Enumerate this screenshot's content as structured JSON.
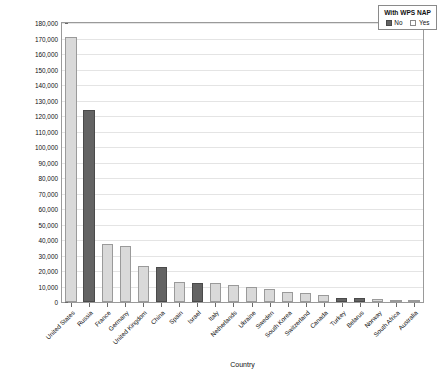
{
  "chart_data": {
    "type": "bar",
    "title": "",
    "xlabel": "Country",
    "ylabel": "Total TIV 2000–2020",
    "ylim": [
      0,
      180000
    ],
    "ytick_step": 10000,
    "grid": true,
    "legend_position": "top-right",
    "legend_title": "With WPS NAP",
    "categories": [
      "United States",
      "Russia",
      "France",
      "Germany",
      "United Kingdom",
      "China",
      "Spain",
      "Israel",
      "Italy",
      "Netherlands",
      "Ukraine",
      "Sweden",
      "South Korea",
      "Switzerland",
      "Canada",
      "Turkey",
      "Belarus",
      "Norway",
      "South Africa",
      "Australia"
    ],
    "values": [
      171000,
      124000,
      37500,
      36000,
      23500,
      22500,
      13000,
      12500,
      12400,
      11200,
      9500,
      8200,
      6600,
      5800,
      4500,
      2400,
      2300,
      1800,
      1600,
      1500
    ],
    "groups": [
      "Yes",
      "No",
      "Yes",
      "Yes",
      "Yes",
      "No",
      "Yes",
      "No",
      "Yes",
      "Yes",
      "Yes",
      "Yes",
      "Yes",
      "Yes",
      "Yes",
      "No",
      "No",
      "Yes",
      "Yes",
      "Yes"
    ],
    "ytick_labels": [
      "0",
      "10,000",
      "20,000",
      "30,000",
      "40,000",
      "50,000",
      "60,000",
      "70,000",
      "80,000",
      "90,000",
      "100,000",
      "110,000",
      "120,000",
      "130,000",
      "140,000",
      "150,000",
      "160,000",
      "170,000",
      "180,000"
    ],
    "legend_entries": [
      {
        "label": "No",
        "color": "#636363"
      },
      {
        "label": "Yes",
        "color": "#d9d9d9"
      }
    ],
    "colors": {
      "no": "#636363",
      "yes": "#d9d9d9",
      "grid": "#e4e4e4",
      "axis": "#9a9a9a",
      "text": "#111111",
      "background": "#ffffff"
    }
  }
}
